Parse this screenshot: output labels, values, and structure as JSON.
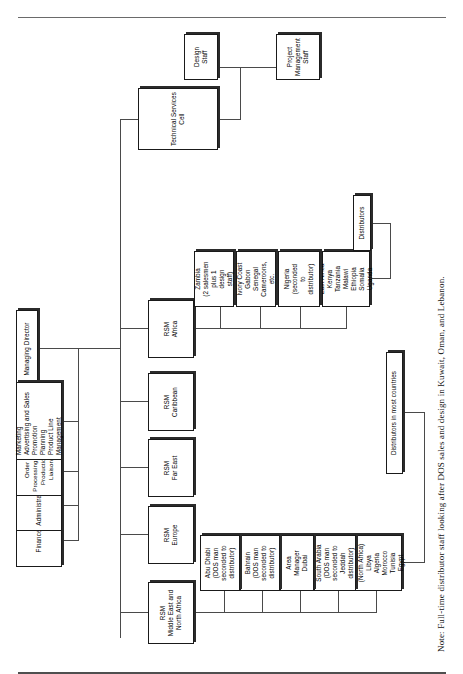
{
  "chart": {
    "root": {
      "label": "Managing Director"
    },
    "staff_functions": [
      {
        "label": "Finance"
      },
      {
        "label": "Administration"
      },
      {
        "label": "Order Processing and Production Liaison"
      },
      {
        "label": "Marketing\nAdvertising and Sales Promotion\nPlanning\nProduct Line Management"
      }
    ],
    "technical_services": {
      "label": "Technical Services Cell",
      "children": [
        {
          "label": "Design\nStaff"
        },
        {
          "label": "Project\nManagement\nStaff"
        }
      ]
    },
    "regional_managers": [
      {
        "label": "RSM\nMiddle East and\nNorth Africa"
      },
      {
        "label": "RSM\nEurope"
      },
      {
        "label": "RSM\nFar East"
      },
      {
        "label": "RSM\nCaribbean"
      },
      {
        "label": "RSM\nAfrica"
      }
    ],
    "mena_units": [
      {
        "label": "Area Manager\n(North Africa)\nLibya\nAlgeria\nMorocco\nTunisia\nEgypt"
      },
      {
        "label": "South Arabia\n(DOS man\nseconded to\nJeddah\ndistributor)"
      },
      {
        "label": "Area\nManager\nDubai"
      },
      {
        "label": "Bahrain\n(DOS man\nseconded to\ndistributor)"
      },
      {
        "label": "Abu Dhabi\n(DOS man\nseconded to\ndistributor)"
      }
    ],
    "africa_units": [
      {
        "label": "East Africa\nKenya\nTanzania\nMalawi\nEthiopia\nSomalia\nUganda"
      },
      {
        "label": "Nigeria\n(seconded\nto\ndistributor)"
      },
      {
        "label": "Ivory Coast\nGabon\nSenegal\nCameroons,\netc."
      },
      {
        "label": "Zambia\n(2 salesmen\nplus 1\ndesign\nstaff)"
      }
    ],
    "distributor_nodes": [
      {
        "label": "Distributors in most countries"
      },
      {
        "label": "Distributors"
      }
    ],
    "note": "Note: Full-time distributor staff looking after DOS sales and design in Kuwait, Oman, and Lebanon.",
    "colors": {
      "line": "#4a4a4a",
      "box_border": "#1a1a1a",
      "text": "#000000",
      "background": "#ffffff"
    }
  }
}
